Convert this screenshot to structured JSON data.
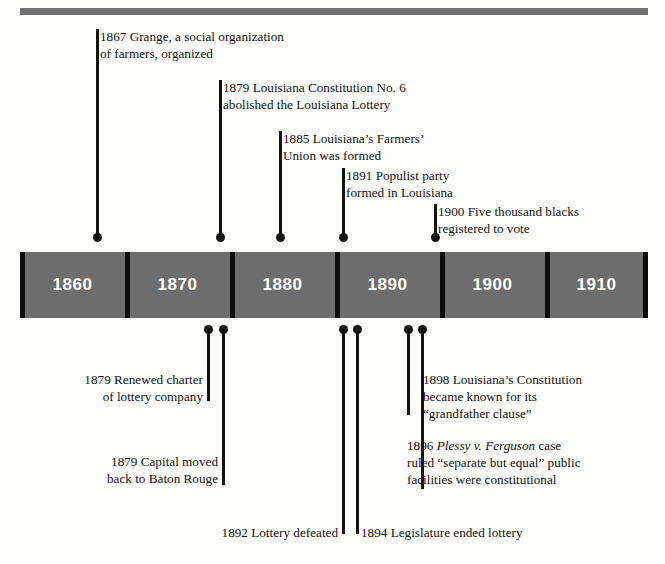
{
  "figure": {
    "kind": "historical-timeline",
    "bar_color": "#6d6d6d",
    "divider_color": "#0d0d0d",
    "text_color": "#141414",
    "label_text_color": "#ffffff"
  },
  "timeline": {
    "decades": [
      {
        "label": "1860"
      },
      {
        "label": "1870"
      },
      {
        "label": "1880"
      },
      {
        "label": "1890"
      },
      {
        "label": "1900"
      },
      {
        "label": "1910"
      }
    ]
  },
  "events_above": [
    {
      "year": "1867",
      "text": "1867 Grange, a social organization\nof farmers, organized"
    },
    {
      "year": "1879",
      "text": "1879 Louisiana Constitution No. 6\nabolished the Louisiana Lottery"
    },
    {
      "year": "1885",
      "text": "1885 Louisiana’s Farmers’\nUnion was formed"
    },
    {
      "year": "1891",
      "text": "1891 Populist party\nformed in Louisiana"
    },
    {
      "year": "1900",
      "text": "1900 Five thousand blacks\nregistered to vote"
    }
  ],
  "events_below": [
    {
      "year": "1879",
      "text": "1879 Renewed charter\nof lottery company"
    },
    {
      "year": "1879",
      "text": "1879 Capital moved\nback to Baton Rouge"
    },
    {
      "year": "1892",
      "text": "1892 Lottery defeated"
    },
    {
      "year": "1894",
      "text": "1894 Legislature ended lottery"
    },
    {
      "year": "1898",
      "text": "1898 Louisiana’s Constitution\nbecame known for its\n“grandfather clause”"
    },
    {
      "year": "1896",
      "text_line1_pre": "1896 ",
      "text_line1_italic": "Plessy v. Ferguson",
      "text_line1_post": " case",
      "text_rest": "ruled “separate but equal” public\nfacilities were constitutional"
    }
  ]
}
